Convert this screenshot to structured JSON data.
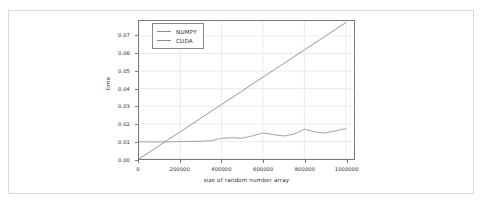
{
  "chart_data": {
    "type": "line",
    "title": "",
    "xlabel": "size of random number array",
    "ylabel": "time",
    "xlim": [
      0,
      1040000
    ],
    "ylim": [
      0,
      0.0785
    ],
    "grid": true,
    "legend_position": "upper left",
    "xticks": [
      0,
      200000,
      400000,
      600000,
      800000,
      1000000
    ],
    "xticklabels": [
      "0",
      "200000",
      "400000",
      "600000",
      "800000",
      "1000000"
    ],
    "yticks": [
      0.0,
      0.01,
      0.02,
      0.03,
      0.04,
      0.05,
      0.06,
      0.07
    ],
    "yticklabels": [
      "0.00",
      "0.01",
      "0.02",
      "0.03",
      "0.04",
      "0.05",
      "0.06",
      "0.07"
    ],
    "x": [
      0,
      50000,
      100000,
      150000,
      200000,
      250000,
      300000,
      350000,
      400000,
      450000,
      500000,
      550000,
      600000,
      650000,
      700000,
      750000,
      800000,
      850000,
      900000,
      950000,
      1000000
    ],
    "series": [
      {
        "name": "NUMPY",
        "color": "#8a8a8a",
        "values": [
          0.0,
          0.0039,
          0.0078,
          0.0117,
          0.0155,
          0.0194,
          0.0233,
          0.0272,
          0.0311,
          0.0349,
          0.0388,
          0.0427,
          0.0466,
          0.0504,
          0.0543,
          0.0582,
          0.0621,
          0.0659,
          0.0698,
          0.0737,
          0.0776
        ]
      },
      {
        "name": "CUDA",
        "color": "#9a9a9a",
        "values": [
          0.0098,
          0.0097,
          0.0097,
          0.0098,
          0.0099,
          0.01,
          0.0101,
          0.0104,
          0.0118,
          0.0121,
          0.0118,
          0.0132,
          0.0148,
          0.0139,
          0.0131,
          0.0141,
          0.017,
          0.0154,
          0.0148,
          0.016,
          0.0173
        ]
      }
    ],
    "legend": [
      "NUMPY",
      "CUDA"
    ]
  },
  "legend": {
    "entries": [
      {
        "label": "NUMPY"
      },
      {
        "label": "CUDA"
      }
    ]
  },
  "axis": {
    "xlabel": "size of random number array",
    "ylabel": "time"
  },
  "colors": {
    "numpy_line": "#8a8a8a",
    "cuda_line": "#9a9a9a",
    "grid": "#dfe3e8",
    "axes_border": "#7a7a7a",
    "card_border": "#d9d9d9",
    "background": "#ffffff"
  }
}
